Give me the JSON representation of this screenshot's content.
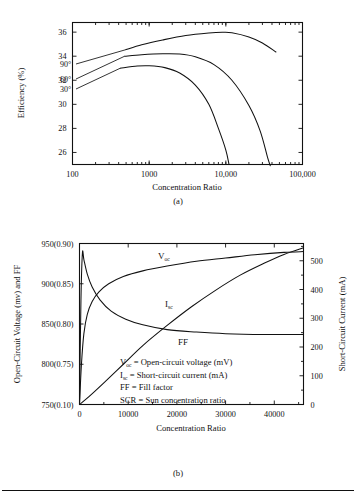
{
  "figure": {
    "panel_a_caption": "(a)",
    "panel_b_caption": "(b)"
  },
  "chart_data": [
    {
      "type": "line",
      "id": "panel-a",
      "title": "",
      "xlabel": "Concentration Ratio",
      "ylabel": "Efficiency (%)",
      "xscale": "log",
      "xlim": [
        100,
        100000
      ],
      "ylim": [
        25,
        36.8
      ],
      "xticks": [
        100,
        1000,
        10000,
        100000
      ],
      "xticklabels": [
        "100",
        "1000",
        "10,000",
        "100,000"
      ],
      "yticks": [
        26,
        28,
        30,
        32,
        34,
        36
      ],
      "yticklabels": [
        "26",
        "28",
        "30",
        "32",
        "34",
        "36"
      ],
      "grid": false,
      "legend_position": "in-plot-left",
      "series": [
        {
          "name": "90°",
          "label": "90°",
          "points": [
            [
              500,
              34.55
            ],
            [
              800,
              34.95
            ],
            [
              1500,
              35.35
            ],
            [
              3000,
              35.72
            ],
            [
              6000,
              35.93
            ],
            [
              9000,
              35.99
            ],
            [
              12000,
              35.95
            ],
            [
              20000,
              35.6
            ],
            [
              30000,
              35.1
            ],
            [
              45000,
              34.35
            ]
          ]
        },
        {
          "name": "60°",
          "label": "60°",
          "points": [
            [
              480,
              34.0
            ],
            [
              800,
              34.12
            ],
            [
              1500,
              34.2
            ],
            [
              2500,
              34.18
            ],
            [
              4000,
              33.95
            ],
            [
              7000,
              33.3
            ],
            [
              12000,
              32.0
            ],
            [
              20000,
              29.9
            ],
            [
              28000,
              27.8
            ],
            [
              35000,
              25.6
            ],
            [
              38000,
              24.9
            ]
          ]
        },
        {
          "name": "30°",
          "label": "30°",
          "points": [
            [
              420,
              33.0
            ],
            [
              700,
              33.18
            ],
            [
              1000,
              33.2
            ],
            [
              1600,
              33.05
            ],
            [
              2500,
              32.6
            ],
            [
              4000,
              31.6
            ],
            [
              6000,
              30.0
            ],
            [
              8000,
              28.0
            ],
            [
              10000,
              26.2
            ],
            [
              11000,
              25.0
            ]
          ]
        }
      ]
    },
    {
      "type": "line",
      "id": "panel-b",
      "title": "",
      "xlabel": "Concentration Ratio",
      "ylabel_left": "Open-Circuit Voltage (mv) and FF",
      "ylabel_right": "Short-Circuit Current (mA)",
      "xscale": "linear",
      "xlim": [
        0,
        46000
      ],
      "xticks": [
        0,
        10000,
        20000,
        30000,
        40000
      ],
      "xticklabels": [
        "0",
        "10000",
        "20000",
        "30000",
        "40000"
      ],
      "ylim_left": [
        750,
        950
      ],
      "yticks_left": [
        750,
        800,
        850,
        900,
        950
      ],
      "yticklabels_left": [
        "750(0.10)",
        "800(0.75)",
        "850(0.80)",
        "900(0.85)",
        "950(0.90)"
      ],
      "ylim_right": [
        0,
        560
      ],
      "yticks_right": [
        0,
        100,
        200,
        300,
        400,
        500
      ],
      "yticklabels_right": [
        "0",
        "100",
        "200",
        "300",
        "400",
        "500"
      ],
      "grid": false,
      "series": [
        {
          "name": "V_oc",
          "label": "V",
          "label_sub": "oc",
          "axis": "left",
          "points": [
            [
              0,
              750
            ],
            [
              400,
              800
            ],
            [
              900,
              838
            ],
            [
              1600,
              862
            ],
            [
              2600,
              878
            ],
            [
              4000,
              890
            ],
            [
              6000,
              900
            ],
            [
              9000,
              909
            ],
            [
              13000,
              916
            ],
            [
              18000,
              922
            ],
            [
              24000,
              928
            ],
            [
              30000,
              932
            ],
            [
              36000,
              936
            ],
            [
              42000,
              939
            ],
            [
              46000,
              940
            ]
          ]
        },
        {
          "name": "I_sc",
          "label": "I",
          "label_sub": "sc",
          "axis": "right",
          "points": [
            [
              0,
              0
            ],
            [
              2000,
              28
            ],
            [
              5000,
              75
            ],
            [
              9000,
              140
            ],
            [
              13000,
              205
            ],
            [
              18000,
              275
            ],
            [
              23000,
              340
            ],
            [
              28000,
              398
            ],
            [
              33000,
              450
            ],
            [
              38000,
              492
            ],
            [
              42000,
              522
            ],
            [
              46000,
              545
            ]
          ]
        },
        {
          "name": "FF",
          "label": "FF",
          "label_sub": "",
          "axis": "left",
          "points": [
            [
              0,
              750
            ],
            [
              300,
              880
            ],
            [
              600,
              938
            ],
            [
              900,
              930
            ],
            [
              1600,
              912
            ],
            [
              2600,
              896
            ],
            [
              4200,
              880
            ],
            [
              6500,
              866
            ],
            [
              9500,
              856
            ],
            [
              13000,
              849
            ],
            [
              18000,
              843
            ],
            [
              24000,
              840
            ],
            [
              30000,
              838
            ],
            [
              38000,
              837
            ],
            [
              46000,
              837
            ]
          ]
        }
      ],
      "annotations": [
        {
          "label": "V",
          "sub": "oc",
          "text": " = Open-circuit voltage (mV)"
        },
        {
          "label": "I",
          "sub": "sc",
          "text": " = Short-circuit current (mA)"
        },
        {
          "label": "FF",
          "sub": "",
          "text": " = Fill  factor"
        },
        {
          "label": "SCR",
          "sub": "",
          "text": " = Sun concentration ratio"
        }
      ]
    }
  ]
}
